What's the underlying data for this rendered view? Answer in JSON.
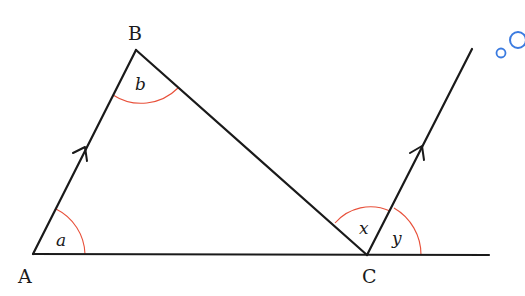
{
  "diagram": {
    "type": "geometry",
    "points": {
      "A": {
        "label": "A",
        "x": 33,
        "y": 254
      },
      "B": {
        "label": "B",
        "x": 136,
        "y": 50
      },
      "C": {
        "label": "C",
        "x": 367,
        "y": 255
      }
    },
    "angles": {
      "a": {
        "label": "a",
        "at": "A"
      },
      "b": {
        "label": "b",
        "at": "B"
      },
      "x": {
        "label": "x",
        "at": "C",
        "between": "CB and parallel ray"
      },
      "y": {
        "label": "y",
        "at": "C",
        "between": "parallel ray and extended line"
      }
    },
    "parallel_marker": "single arrow",
    "colors": {
      "line": "#1a1a1a",
      "angle_arc": "#e8503a",
      "bubble_icon": "#3b7be0"
    }
  },
  "icons": {
    "bubbles": "thought-bubble-icon"
  }
}
